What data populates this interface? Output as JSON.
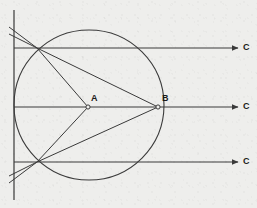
{
  "figure": {
    "width": 257,
    "height": 208,
    "background_color": "#eeeeec",
    "stroke_color": "#3a3a3a",
    "label_color": "#1a1a1a"
  },
  "labels": {
    "point_a": "A",
    "point_b": "B",
    "ray_top": "C",
    "ray_middle": "C",
    "ray_bottom": "C"
  },
  "geometry": {
    "axis": {
      "name": "vertical-axis",
      "x": 14,
      "y_top": 10,
      "y_bottom": 200
    },
    "circle": {
      "cx": 89,
      "cy": 105,
      "r": 75
    },
    "points": [
      {
        "id": "A",
        "x": 88,
        "y": 107,
        "label_x": 91,
        "label_y": 95
      },
      {
        "id": "B",
        "x": 158,
        "y": 107,
        "label_x": 162,
        "label_y": 95
      },
      {
        "id": "P_upper",
        "x": 37,
        "y": 48
      },
      {
        "id": "P_lower",
        "x": 37,
        "y": 162
      }
    ],
    "rays": [
      {
        "id": "ray-top",
        "y": 48,
        "x_start": 14,
        "x_end": 238,
        "label_x": 243,
        "label_y": 43
      },
      {
        "id": "ray-middle",
        "y": 107,
        "x_start": 14,
        "x_end": 238,
        "label_x": 243,
        "label_y": 102
      },
      {
        "id": "ray-bottom",
        "y": 162,
        "x_start": 14,
        "x_end": 238,
        "label_x": 243,
        "label_y": 157
      }
    ],
    "chords": [
      {
        "id": "chord-upper-to-B",
        "x1": 37,
        "y1": 48,
        "x2": 158,
        "y2": 107
      },
      {
        "id": "chord-upper-to-A",
        "x1": 37,
        "y1": 48,
        "x2": 88,
        "y2": 107
      },
      {
        "id": "chord-lower-to-B",
        "x1": 37,
        "y1": 162,
        "x2": 158,
        "y2": 107
      },
      {
        "id": "chord-lower-to-A",
        "x1": 37,
        "y1": 162,
        "x2": 88,
        "y2": 107
      }
    ],
    "extensions": [
      {
        "id": "ext-upper-1",
        "x1": 37,
        "y1": 48,
        "x2": 9,
        "y2": 34
      },
      {
        "id": "ext-upper-2",
        "x1": 37,
        "y1": 48,
        "x2": 9,
        "y2": 28
      },
      {
        "id": "ext-lower-1",
        "x1": 37,
        "y1": 162,
        "x2": 9,
        "y2": 176
      },
      {
        "id": "ext-lower-2",
        "x1": 37,
        "y1": 162,
        "x2": 9,
        "y2": 182
      }
    ]
  }
}
